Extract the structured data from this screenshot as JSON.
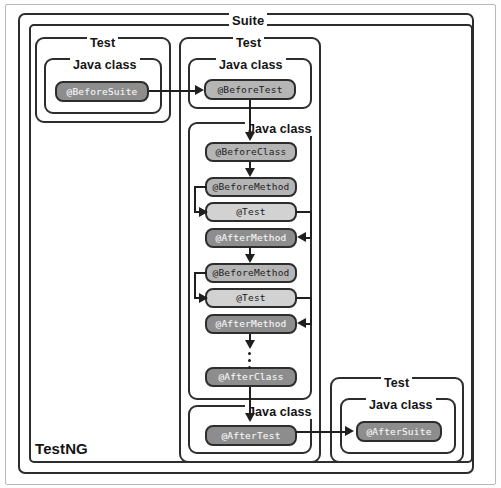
{
  "diagram": {
    "title": "TestNG",
    "outer_label": "TestNG",
    "suite_label": "Suite",
    "test_label_left": "Test",
    "test_label_main": "Test",
    "test_label_right": "Test",
    "javaclass_label_1": "Java class",
    "javaclass_label_2": "Java class",
    "javaclass_label_3": "Java class",
    "javaclass_label_4": "Java class",
    "javaclass_label_5": "Java class",
    "annotations": {
      "before_suite": "@BeforeSuite",
      "before_test": "@BeforeTest",
      "before_class": "@BeforeClass",
      "before_method_1": "@BeforeMethod",
      "test_1": "@Test",
      "after_method_1": "@AfterMethod",
      "before_method_2": "@BeforeMethod",
      "test_2": "@Test",
      "after_method_2": "@AfterMethod",
      "after_class": "@AfterClass",
      "after_test": "@AfterTest",
      "after_suite": "@AfterSuite"
    },
    "colors": {
      "pill_dark": "#8d8d8d",
      "pill_medium": "#b5b5b5",
      "pill_light": "#d2d2d2",
      "border": "#2d2d2d",
      "page": "#ffffff"
    }
  }
}
